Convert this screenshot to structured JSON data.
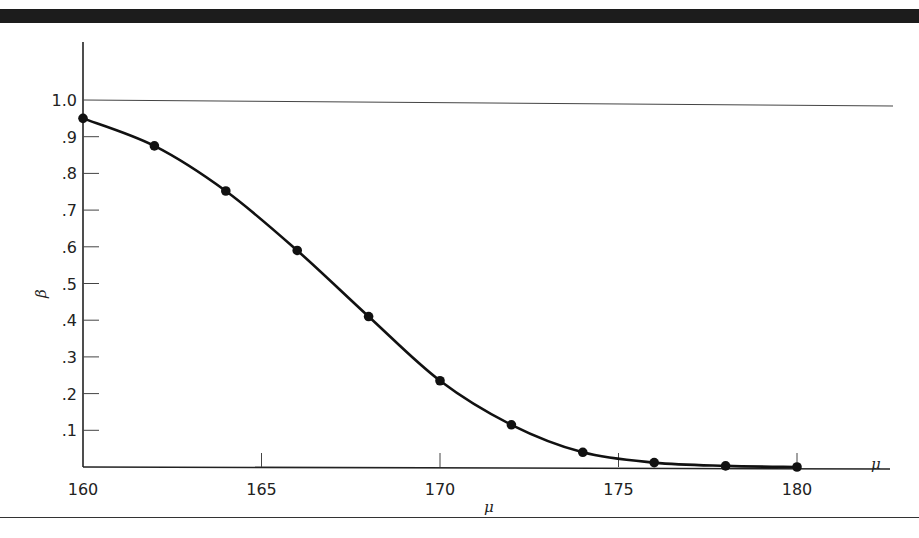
{
  "chart_data": {
    "type": "line",
    "title": "",
    "xlabel": "μ",
    "ylabel": "β",
    "x": [
      160,
      162,
      164,
      166,
      168,
      170,
      172,
      174,
      176,
      178,
      180
    ],
    "series": [
      {
        "name": "β",
        "values": [
          0.95,
          0.875,
          0.752,
          0.59,
          0.41,
          0.235,
          0.115,
          0.04,
          0.012,
          0.003,
          0.0
        ]
      }
    ],
    "xlim": [
      160,
      182.5
    ],
    "ylim": [
      0,
      1.1
    ],
    "x_ticks": [
      160,
      165,
      170,
      175,
      180
    ],
    "x_tick_labels": [
      "160",
      "165",
      "170",
      "175",
      "180"
    ],
    "y_ticks": [
      0.1,
      0.2,
      0.3,
      0.4,
      0.5,
      0.6,
      0.7,
      0.8,
      0.9,
      1.0
    ],
    "y_tick_labels": [
      ".1",
      ".2",
      ".3",
      ".4",
      ".5",
      ".6",
      ".7",
      ".8",
      ".9",
      "1.0"
    ],
    "reference_line": {
      "y": 1.0
    },
    "markers": true,
    "grid": false,
    "legend": null
  },
  "labels": {
    "x_axis_end": "μ",
    "x_axis_below": "μ",
    "y_axis": "β"
  }
}
